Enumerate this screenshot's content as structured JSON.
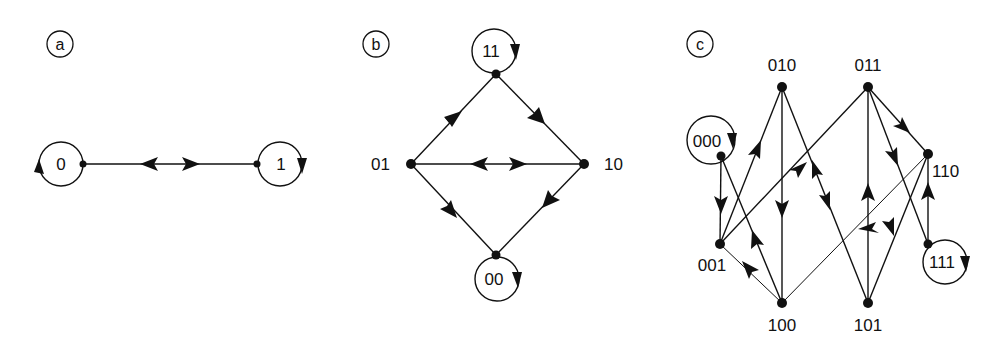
{
  "figure": {
    "panels": [
      {
        "id": "a",
        "label": "a",
        "nodes": [
          {
            "id": "0",
            "label": "0",
            "self_loop": true
          },
          {
            "id": "1",
            "label": "1",
            "self_loop": true
          }
        ],
        "edges": [
          {
            "from": "0",
            "to": "1"
          },
          {
            "from": "1",
            "to": "0"
          }
        ]
      },
      {
        "id": "b",
        "label": "b",
        "nodes": [
          {
            "id": "11",
            "label": "11",
            "self_loop": true
          },
          {
            "id": "01",
            "label": "01",
            "self_loop": false
          },
          {
            "id": "10",
            "label": "10",
            "self_loop": false
          },
          {
            "id": "00",
            "label": "00",
            "self_loop": true
          }
        ],
        "edges": [
          {
            "from": "01",
            "to": "11"
          },
          {
            "from": "11",
            "to": "10"
          },
          {
            "from": "01",
            "to": "10"
          },
          {
            "from": "10",
            "to": "01"
          },
          {
            "from": "10",
            "to": "00"
          },
          {
            "from": "00",
            "to": "01"
          }
        ]
      },
      {
        "id": "c",
        "label": "c",
        "nodes": [
          {
            "id": "000",
            "label": "000",
            "self_loop": true
          },
          {
            "id": "001",
            "label": "001",
            "self_loop": false
          },
          {
            "id": "010",
            "label": "010",
            "self_loop": false
          },
          {
            "id": "011",
            "label": "011",
            "self_loop": false
          },
          {
            "id": "100",
            "label": "100",
            "self_loop": false
          },
          {
            "id": "101",
            "label": "101",
            "self_loop": false
          },
          {
            "id": "110",
            "label": "110",
            "self_loop": false
          },
          {
            "id": "111",
            "label": "111",
            "self_loop": true
          }
        ],
        "edges": [
          {
            "from": "000",
            "to": "001"
          },
          {
            "from": "001",
            "to": "010"
          },
          {
            "from": "001",
            "to": "011"
          },
          {
            "from": "100",
            "to": "000"
          },
          {
            "from": "100",
            "to": "001"
          },
          {
            "from": "010",
            "to": "100"
          },
          {
            "from": "010",
            "to": "101"
          },
          {
            "from": "101",
            "to": "010"
          },
          {
            "from": "011",
            "to": "110"
          },
          {
            "from": "011",
            "to": "111"
          },
          {
            "from": "101",
            "to": "011"
          },
          {
            "from": "110",
            "to": "001"
          },
          {
            "from": "110",
            "to": "101"
          },
          {
            "from": "111",
            "to": "110"
          }
        ]
      }
    ]
  }
}
